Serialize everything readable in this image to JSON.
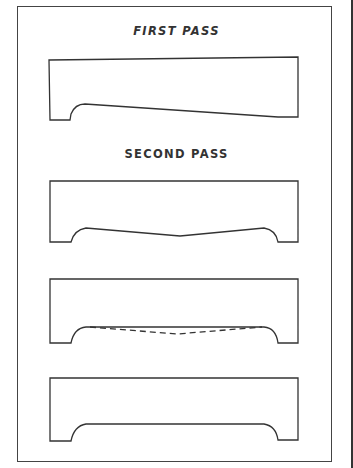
{
  "figure": {
    "labels": {
      "first_pass": "FIRST PASS",
      "second_pass": "SECOND PASS"
    },
    "panels": [
      {
        "name": "first-pass-profile",
        "description": "Board with notch at left end and sloped bottom edge tapering toward right"
      },
      {
        "name": "second-pass-profile-v",
        "description": "Board with notches at both ends and V-shaped bottom edge meeting at center"
      },
      {
        "name": "second-pass-profile-dashed",
        "description": "Board with notches at both ends, straight bottom edge with dashed V line indicating removed material"
      },
      {
        "name": "final-profile",
        "description": "Board with notches at both ends and straight flat bottom edge"
      }
    ],
    "colors": {
      "line": "#333333",
      "background": "#ffffff"
    }
  }
}
